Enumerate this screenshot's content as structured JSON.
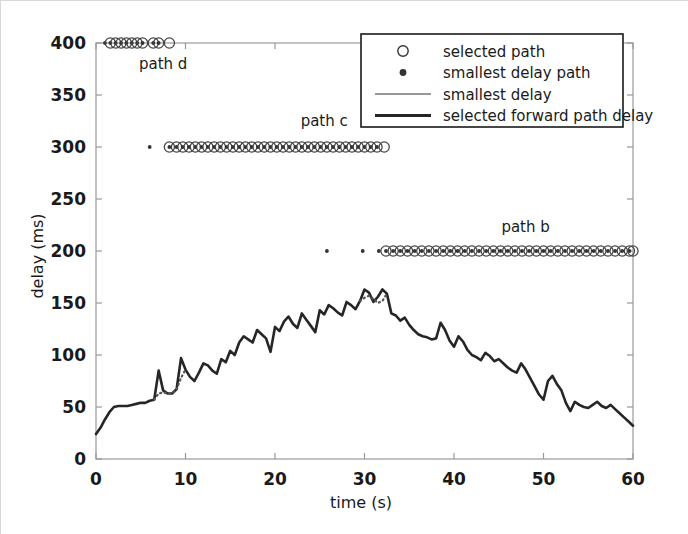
{
  "chart_data": {
    "type": "line",
    "title": "",
    "xlabel": "time (s)",
    "ylabel": "delay (ms)",
    "xlim": [
      0,
      60
    ],
    "ylim": [
      0,
      400
    ],
    "xticks": [
      0,
      10,
      20,
      30,
      40,
      50,
      60
    ],
    "yticks": [
      0,
      50,
      100,
      150,
      200,
      250,
      300,
      350,
      400
    ],
    "grid": false,
    "legend_position": "upper right",
    "legend": [
      {
        "label": "selected path",
        "marker": "open-circle",
        "type": "marker"
      },
      {
        "label": "smallest delay path",
        "marker": "filled-dot",
        "type": "marker"
      },
      {
        "label": "smallest delay",
        "marker": "thin-line",
        "type": "line"
      },
      {
        "label": "selected forward path delay",
        "marker": "thick-line",
        "type": "line"
      }
    ],
    "annotations": [
      {
        "text": "path d",
        "x": 7.5,
        "y": 375
      },
      {
        "text": "path c",
        "x": 25.5,
        "y": 320
      },
      {
        "text": "path b",
        "x": 48.0,
        "y": 218
      }
    ],
    "series": [
      {
        "name": "selected forward path delay",
        "style": "thick solid black line",
        "x": [
          0.0,
          0.5,
          1.0,
          1.5,
          2.0,
          2.5,
          3.0,
          3.5,
          4.0,
          4.5,
          5.0,
          5.5,
          6.0,
          6.5,
          7.0,
          7.5,
          8.0,
          8.5,
          9.0,
          9.5,
          10.0,
          10.5,
          11.0,
          11.5,
          12.0,
          12.5,
          13.0,
          13.5,
          14.0,
          14.5,
          15.0,
          15.5,
          16.0,
          16.5,
          17.0,
          17.5,
          18.0,
          18.5,
          19.0,
          19.5,
          20.0,
          20.5,
          21.0,
          21.5,
          22.0,
          22.5,
          23.0,
          23.5,
          24.0,
          24.5,
          25.0,
          25.5,
          26.0,
          26.5,
          27.0,
          27.5,
          28.0,
          28.5,
          29.0,
          29.5,
          30.0,
          30.5,
          31.0,
          31.5,
          32.0,
          32.5,
          33.0,
          33.5,
          34.0,
          34.5,
          35.0,
          35.5,
          36.0,
          36.5,
          37.0,
          37.5,
          38.0,
          38.5,
          39.0,
          39.5,
          40.0,
          40.5,
          41.0,
          41.5,
          42.0,
          42.5,
          43.0,
          43.5,
          44.0,
          44.5,
          45.0,
          45.5,
          46.0,
          46.5,
          47.0,
          47.5,
          48.0,
          48.5,
          49.0,
          49.5,
          50.0,
          50.5,
          51.0,
          51.5,
          52.0,
          52.5,
          53.0,
          53.5,
          54.0,
          54.5,
          55.0,
          55.5,
          56.0,
          56.5,
          57.0,
          57.5,
          58.0,
          58.5,
          59.0,
          59.5,
          60.0
        ],
        "y": [
          24,
          30,
          38,
          45,
          50,
          51,
          51,
          51,
          52,
          53,
          54,
          54,
          56,
          57,
          85,
          66,
          63,
          63,
          67,
          97,
          86,
          79,
          75,
          83,
          92,
          90,
          85,
          82,
          96,
          93,
          104,
          100,
          112,
          118,
          115,
          112,
          124,
          120,
          116,
          103,
          127,
          123,
          132,
          137,
          130,
          126,
          140,
          134,
          128,
          122,
          143,
          139,
          148,
          145,
          141,
          138,
          151,
          148,
          144,
          152,
          163,
          160,
          151,
          156,
          163,
          159,
          140,
          138,
          133,
          136,
          129,
          124,
          120,
          118,
          117,
          115,
          116,
          131,
          124,
          114,
          108,
          118,
          113,
          105,
          100,
          98,
          95,
          102,
          99,
          94,
          96,
          92,
          88,
          85,
          83,
          92,
          86,
          78,
          70,
          62,
          57,
          75,
          80,
          72,
          66,
          54,
          46,
          55,
          52,
          50,
          49,
          52,
          55,
          51,
          49,
          52,
          48,
          44,
          40,
          36,
          32
        ]
      },
      {
        "name": "smallest delay",
        "style": "thin dotted overlay segments",
        "segments": [
          {
            "x": [
              6.5,
              7.0,
              7.5,
              8.0,
              8.5,
              9.0,
              9.5,
              10.0
            ],
            "y": [
              57,
              63,
              64,
              63,
              63,
              67,
              78,
              86
            ]
          },
          {
            "x": [
              29.5,
              30.0,
              30.5,
              31.0,
              31.5,
              32.0,
              32.5
            ],
            "y": [
              152,
              155,
              157,
              154,
              150,
              152,
              159
            ]
          }
        ]
      },
      {
        "name": "path d selected",
        "marker": "open-circle-with-dot",
        "y_level": 400,
        "x": [
          1.0,
          1.6,
          2.2,
          2.8,
          3.4,
          4.0,
          4.6,
          5.2,
          6.4,
          7.0,
          8.2
        ]
      },
      {
        "name": "path c selected",
        "marker": "open-circle-with-dot",
        "y_level": 300,
        "x": [
          6.0,
          8.2,
          9.0,
          9.7,
          10.4,
          11.1,
          11.8,
          12.5,
          13.2,
          13.9,
          14.6,
          15.3,
          16.0,
          16.7,
          17.4,
          18.1,
          18.8,
          19.5,
          20.2,
          20.9,
          21.6,
          22.3,
          23.0,
          23.7,
          24.4,
          25.1,
          25.8,
          26.5,
          27.2,
          27.9,
          28.6,
          29.3,
          30.0,
          30.7,
          31.4,
          32.2
        ]
      },
      {
        "name": "path b selected",
        "marker": "open-circle-with-dot",
        "y_level": 200,
        "x": [
          25.8,
          29.8,
          31.6,
          32.4,
          33.2,
          34.0,
          34.8,
          35.6,
          36.4,
          37.2,
          38.0,
          38.8,
          39.6,
          40.4,
          41.2,
          42.0,
          42.8,
          43.6,
          44.4,
          45.2,
          46.0,
          46.8,
          47.6,
          48.4,
          49.2,
          50.0,
          50.8,
          51.6,
          52.4,
          53.2,
          54.0,
          54.8,
          55.6,
          56.4,
          57.2,
          58.0,
          58.8,
          59.6,
          60.0
        ]
      }
    ]
  },
  "colors": {
    "line": "#262626",
    "axis": "#999999",
    "text": "#1a1a1a",
    "background": "#ffffff",
    "border": "#d8d8d8"
  }
}
